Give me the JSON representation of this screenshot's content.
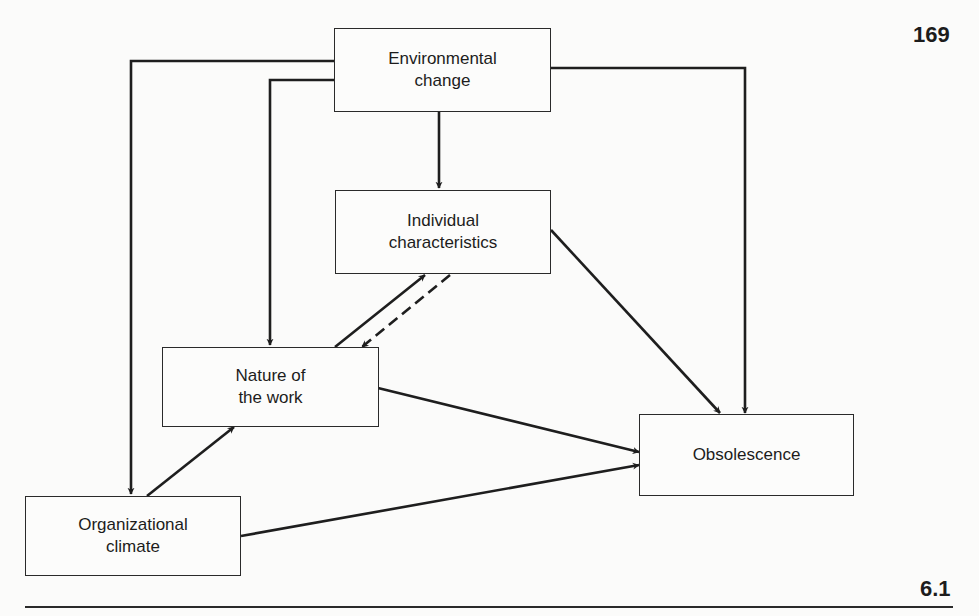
{
  "page": {
    "number": "169",
    "figure": "6.1"
  },
  "nodes": {
    "environmental_change": {
      "label": "Environmental\nchange"
    },
    "individual_characteristics": {
      "label": "Individual\ncharacteristics"
    },
    "nature_of_work": {
      "label": "Nature of\nthe work"
    },
    "obsolescence": {
      "label": "Obsolescence"
    },
    "organizational_climate": {
      "label": "Organizational\nclimate"
    }
  },
  "edges": [
    {
      "from": "Environmental change",
      "to": "Individual characteristics",
      "style": "solid"
    },
    {
      "from": "Environmental change",
      "to": "Nature of the work",
      "style": "solid"
    },
    {
      "from": "Environmental change",
      "to": "Organizational climate",
      "style": "solid"
    },
    {
      "from": "Environmental change",
      "to": "Obsolescence",
      "style": "solid"
    },
    {
      "from": "Nature of the work",
      "to": "Individual characteristics",
      "style": "solid"
    },
    {
      "from": "Individual characteristics",
      "to": "Nature of the work",
      "style": "dashed"
    },
    {
      "from": "Individual characteristics",
      "to": "Obsolescence",
      "style": "solid"
    },
    {
      "from": "Nature of the work",
      "to": "Obsolescence",
      "style": "solid"
    },
    {
      "from": "Organizational climate",
      "to": "Nature of the work",
      "style": "solid"
    },
    {
      "from": "Organizational climate",
      "to": "Obsolescence",
      "style": "solid"
    }
  ]
}
